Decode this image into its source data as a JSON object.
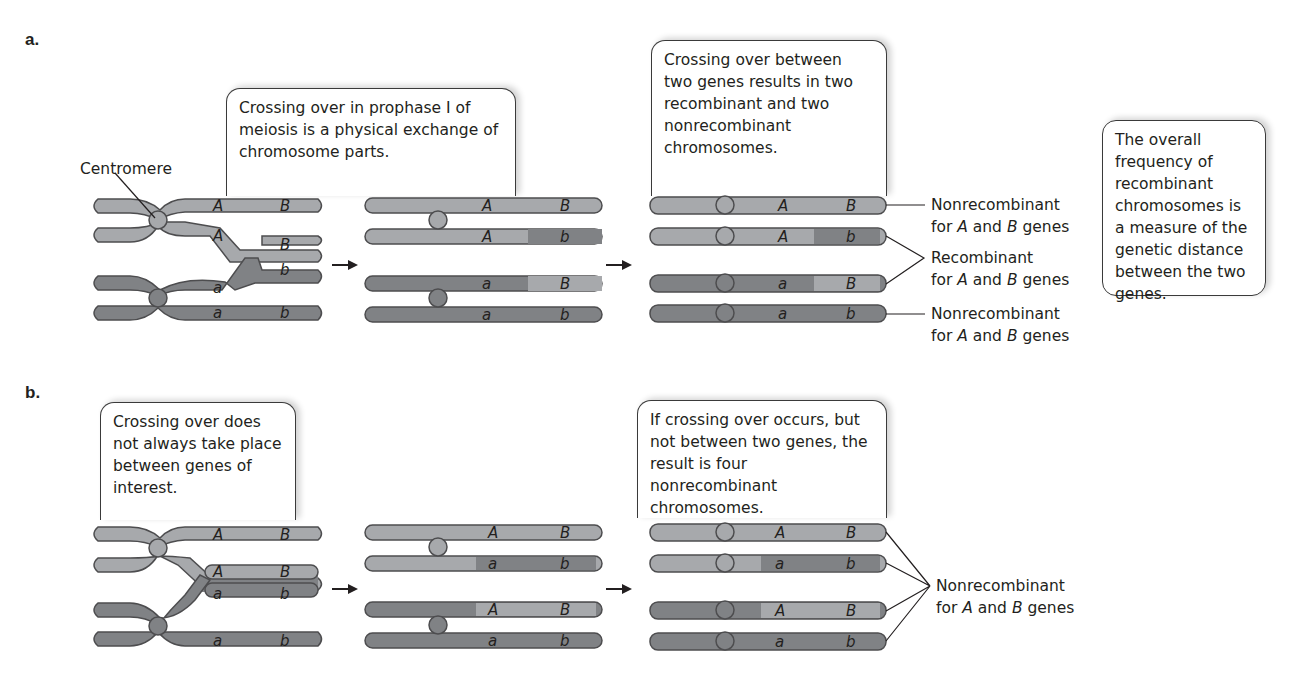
{
  "panels": {
    "a": {
      "label": "a.",
      "centromere_label": "Centromere",
      "callout_1": "Crossing over in prophase I of meiosis is a physical exchange of chromosome parts.",
      "callout_2": "Crossing over between two genes results in two recombinant and two nonrecombinant chromosomes.",
      "callout_3": "The overall frequency of recombinant chromosomes is a measure of the genetic distance between the two genes.",
      "results": [
        {
          "alleles": [
            "A",
            "B"
          ],
          "type": "Nonrecombinant"
        },
        {
          "alleles": [
            "A",
            "b"
          ],
          "type": "Recombinant"
        },
        {
          "alleles": [
            "a",
            "B"
          ],
          "type": "Recombinant"
        },
        {
          "alleles": [
            "a",
            "b"
          ],
          "type": "Nonrecombinant"
        }
      ],
      "labels": {
        "nonrecombinant_top": "Nonrecombinant",
        "recombinant": "Recombinant",
        "nonrecombinant_bottom": "Nonrecombinant",
        "for_text": "for",
        "gene_A": "A",
        "and_text": "and",
        "gene_B": "B",
        "genes_text": "genes"
      }
    },
    "b": {
      "label": "b.",
      "callout_1": "Crossing over does not always take place between genes of interest.",
      "callout_2": "If crossing over occurs, but not between two genes, the result is four nonrecombinant chromosomes.",
      "results": [
        {
          "alleles": [
            "A",
            "B"
          ]
        },
        {
          "alleles": [
            "a",
            "b"
          ]
        },
        {
          "alleles": [
            "A",
            "B"
          ]
        },
        {
          "alleles": [
            "a",
            "b"
          ]
        }
      ],
      "labels": {
        "nonrecombinant": "Nonrecombinant",
        "for_text": "for",
        "gene_A": "A",
        "and_text": "and",
        "gene_B": "B",
        "genes_text": "genes"
      }
    }
  },
  "colors": {
    "light_chromatid": "#a7a9ac",
    "dark_chromatid": "#808285",
    "outline": "#4d4d4f",
    "text": "#231f20"
  }
}
